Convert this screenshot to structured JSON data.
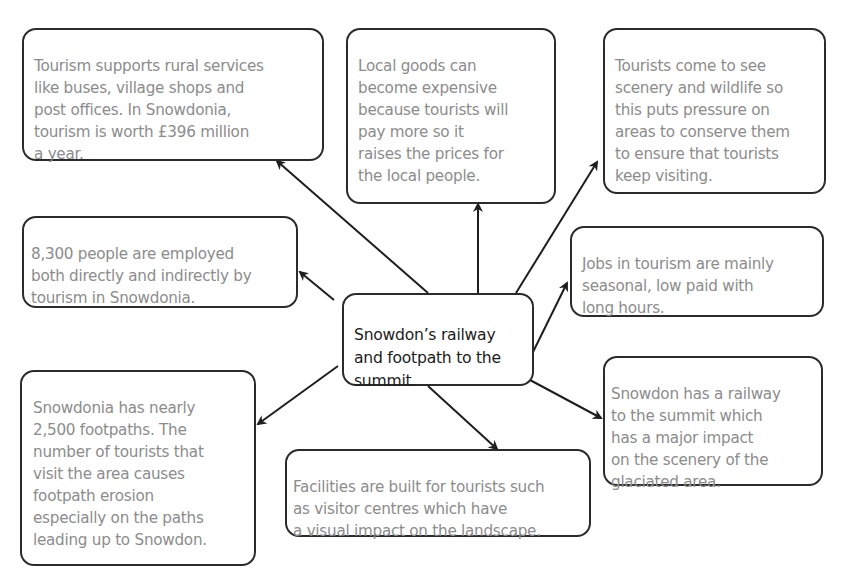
{
  "diagram": {
    "type": "mind-map",
    "colors": {
      "border": "#2b2b2b",
      "node_text": "#8c8c8c",
      "center_text": "#1b1b1b",
      "arrow": "#1e1e1e"
    },
    "center": {
      "text": "Snowdon’s railway\nand footpath to the\nsummit."
    },
    "nodes": [
      {
        "id": "rural-services",
        "text": "Tourism supports rural services\nlike buses, village shops and\npost offices. In Snowdonia,\ntourism is worth £396 million\na year."
      },
      {
        "id": "local-goods",
        "text": "Local goods can\nbecome expensive\nbecause tourists will\npay more so it\nraises the prices for\nthe local people."
      },
      {
        "id": "conservation",
        "text": "Tourists come to see\nscenery and wildlife so\nthis puts pressure on\nareas to conserve them\nto ensure that tourists\nkeep visiting."
      },
      {
        "id": "employment",
        "text": "8,300 people are employed\nboth directly and indirectly by\ntourism in Snowdonia."
      },
      {
        "id": "seasonal-jobs",
        "text": "Jobs in tourism are mainly\nseasonal, low paid with\nlong hours."
      },
      {
        "id": "footpath-erosion",
        "text": "Snowdonia has nearly\n2,500 footpaths. The\nnumber of tourists that\nvisit the area causes\nfootpath erosion\nespecially on the paths\nleading up to Snowdon."
      },
      {
        "id": "facilities",
        "text": "Facilities are built for tourists such\nas visitor centres which have\na visual impact on the landscape."
      },
      {
        "id": "railway-impact",
        "text": "Snowdon has a railway\nto the summit which\nhas a major impact\non the scenery of the\nglaciated area."
      }
    ]
  }
}
